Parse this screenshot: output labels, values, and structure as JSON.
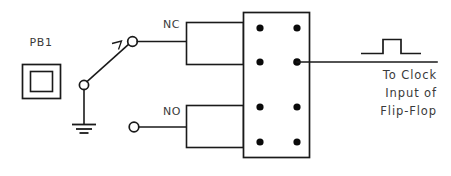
{
  "diagram": {
    "stroke_color": "#1a1a1a",
    "text_color": "#3a3a3a",
    "background_color": "#ffffff"
  },
  "pushbutton": {
    "label": "PB1",
    "name": "push-button-switch"
  },
  "contacts": {
    "nc_label": "NC",
    "no_label": "NO"
  },
  "ground": {
    "label": "",
    "bars": 3
  },
  "terminal_block": {
    "rows": 4,
    "columns": 2,
    "dot_count": 8
  },
  "output": {
    "waveform": "single-positive-pulse",
    "annotation_lines": [
      "To Clock",
      "Input of",
      "Flip-Flop"
    ],
    "line_1": "To Clock",
    "line_2": "Input of",
    "line_3": "Flip-Flop"
  }
}
